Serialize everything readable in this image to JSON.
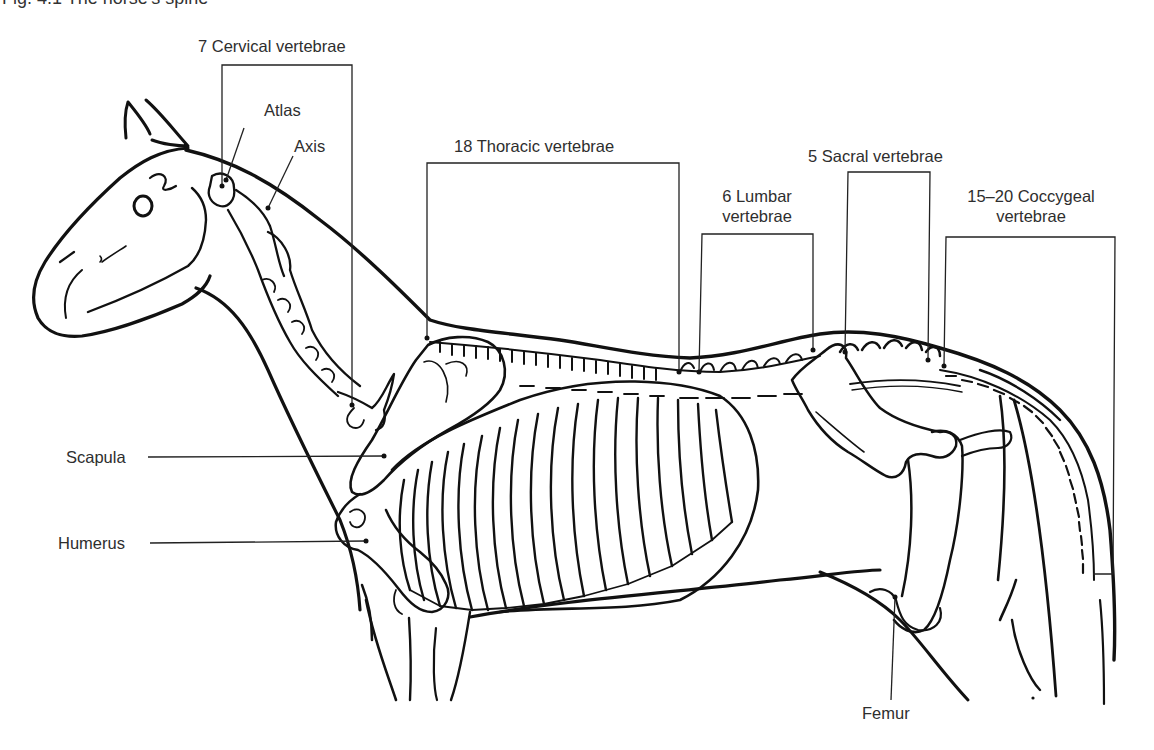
{
  "figure": {
    "caption": "Fig. 4.1  The horse's spine",
    "caption_note": "caption is clipped at top edge of image"
  },
  "labels": {
    "cervical": "7 Cervical vertebrae",
    "atlas": "Atlas",
    "axis": "Axis",
    "thoracic": "18 Thoracic vertebrae",
    "lumbar_line1": "6 Lumbar",
    "lumbar_line2": "vertebrae",
    "sacral": "5 Sacral vertebrae",
    "coccygeal_line1": "15–20 Coccygeal",
    "coccygeal_line2": "vertebrae",
    "scapula": "Scapula",
    "humerus": "Humerus",
    "femur": "Femur"
  },
  "colors": {
    "ink": "#111111",
    "text": "#2e2e2e",
    "background": "#ffffff"
  }
}
